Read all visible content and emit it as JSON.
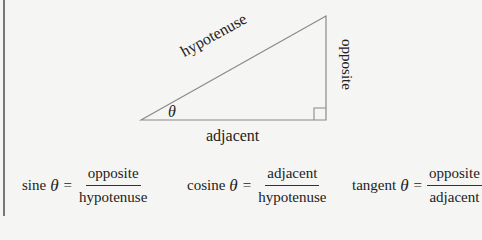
{
  "diagram": {
    "triangle": {
      "vertices": {
        "angle": [
          141,
          120
        ],
        "top": [
          326,
          16
        ],
        "right_angle": [
          326,
          120
        ]
      },
      "stroke": "#8a8a8a",
      "right_angle_box_size": 12
    },
    "labels": {
      "hypotenuse": "hypotenuse",
      "opposite": "opposite",
      "adjacent": "adjacent",
      "angle": "θ"
    }
  },
  "formulas": [
    {
      "name": "sine",
      "symbol": "θ",
      "equals": "=",
      "numerator": "opposite",
      "denominator": "hypotenuse"
    },
    {
      "name": "cosine",
      "symbol": "θ",
      "equals": "=",
      "numerator": "adjacent",
      "denominator": "hypotenuse"
    },
    {
      "name": "tangent",
      "symbol": "θ",
      "equals": "=",
      "numerator": "opposite",
      "denominator": "adjacent"
    }
  ]
}
